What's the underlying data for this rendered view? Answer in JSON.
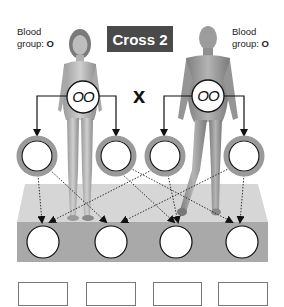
{
  "title": "Cross 2",
  "cross_symbol": "x",
  "mother": {
    "label_line1": "Blood",
    "label_line2_prefix": "group: ",
    "blood_group": "O",
    "genotype": "OO",
    "gametes": [
      "",
      ""
    ]
  },
  "father": {
    "label_line1": "Blood",
    "label_line2_prefix": "group: ",
    "blood_group": "O",
    "genotype": "OO",
    "gametes": [
      "",
      ""
    ]
  },
  "offspring": {
    "genotypes": [
      "",
      "",
      "",
      ""
    ],
    "phenotypes": [
      "",
      "",
      "",
      ""
    ]
  },
  "colors": {
    "title_bg": "#4a4a4a",
    "platform_top": "#d6d6d6",
    "platform_front": "#a9a9a9",
    "gamete_ring": "#9a9a9a"
  }
}
